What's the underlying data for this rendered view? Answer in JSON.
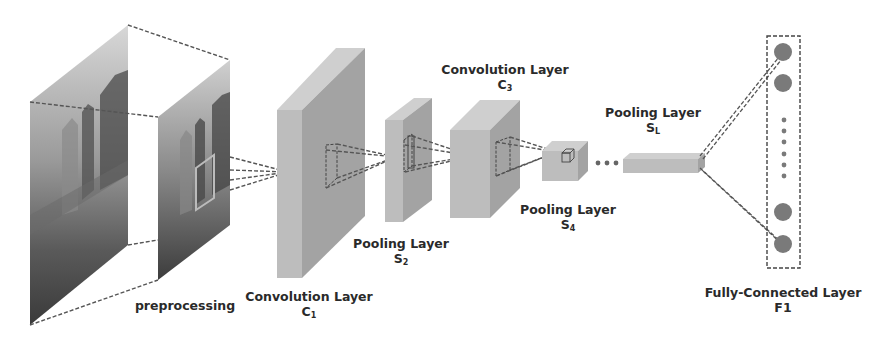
{
  "diagram": {
    "stages": [
      {
        "id": "input",
        "label": "preprocessing",
        "symbol": "",
        "subscript": ""
      },
      {
        "id": "c1",
        "label": "Convolution Layer",
        "symbol": "C",
        "subscript": "1"
      },
      {
        "id": "s2",
        "label": "Pooling Layer",
        "symbol": "S",
        "subscript": "2"
      },
      {
        "id": "c3",
        "label": "Convolution Layer",
        "symbol": "C",
        "subscript": "3"
      },
      {
        "id": "s4",
        "label": "Pooling Layer",
        "symbol": "S",
        "subscript": "4"
      },
      {
        "id": "sl",
        "label": "Pooling Layer",
        "symbol": "S",
        "subscript": "L"
      },
      {
        "id": "f1",
        "label": "Fully-Connected Layer",
        "symbol": "F1",
        "subscript": ""
      }
    ],
    "ellipsis": "• • •",
    "colors": {
      "block_front": "#bdbdbd",
      "block_side": "#a3a3a3",
      "block_top": "#cfcfcf",
      "dashed_line": "#555555",
      "node": "#7a7a7a",
      "text": "#2a2a2a"
    }
  }
}
